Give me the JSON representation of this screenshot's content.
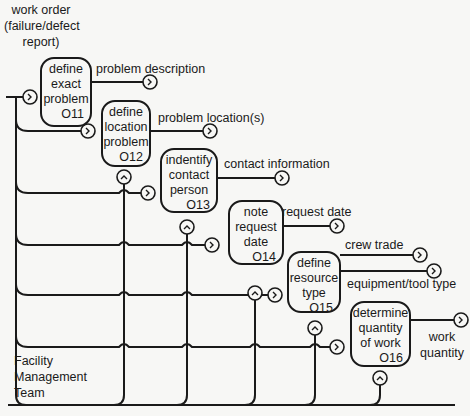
{
  "diagram": {
    "input_label": "work order (failure/defect report)",
    "input_label_lines": [
      "work order",
      "(failure/defect",
      "report)"
    ],
    "mechanism_label_lines": [
      "Facility",
      "Management",
      "Team"
    ],
    "activities": [
      {
        "id": "O11",
        "lines": [
          "define",
          "exact",
          "problem"
        ],
        "outputs": [
          "problem description"
        ]
      },
      {
        "id": "O12",
        "lines": [
          "define",
          "location",
          "problem"
        ],
        "outputs": [
          "problem location(s)"
        ]
      },
      {
        "id": "O13",
        "lines": [
          "indentify",
          "contact",
          "person"
        ],
        "outputs": [
          "contact information"
        ]
      },
      {
        "id": "O14",
        "lines": [
          "note",
          "request",
          "date"
        ],
        "outputs": [
          "request date"
        ]
      },
      {
        "id": "O15",
        "lines": [
          "define",
          "resource",
          "type"
        ],
        "outputs": [
          "crew trade",
          "equipment/tool type"
        ]
      },
      {
        "id": "O16",
        "lines": [
          "determine",
          "quantity",
          "of work"
        ],
        "outputs": [
          "work quantity"
        ],
        "output_lines": [
          "work",
          "quantity"
        ]
      }
    ],
    "connector_glyphs": {
      "and_out": ">",
      "and_up": "^"
    }
  }
}
